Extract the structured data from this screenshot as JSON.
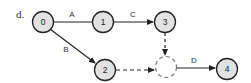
{
  "label": "d.",
  "nodes": [
    {
      "id": "0",
      "label": "0"
    },
    {
      "id": "1",
      "label": "1"
    },
    {
      "id": "2",
      "label": "2"
    },
    {
      "id": "3",
      "label": "3"
    },
    {
      "id": "4",
      "label": "4"
    }
  ],
  "edges": [
    {
      "from": "0",
      "to": "1",
      "label": "A",
      "style": "solid"
    },
    {
      "from": "0",
      "to": "2",
      "label": "B",
      "style": "solid"
    },
    {
      "from": "1",
      "to": "3",
      "label": "C",
      "style": "solid"
    },
    {
      "from": "3",
      "to": "dummy",
      "label": "",
      "style": "dashed"
    },
    {
      "from": "2",
      "to": "dummy",
      "label": "",
      "style": "dashed"
    },
    {
      "from": "dummy",
      "to": "4",
      "label": "D",
      "style": "solid"
    }
  ],
  "colors": {
    "node_fill": "#e2e2e2",
    "stroke": "#222222"
  }
}
